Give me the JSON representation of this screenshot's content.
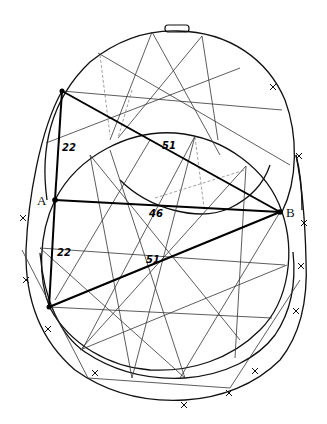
{
  "diagram": {
    "points": {
      "A": {
        "label": "A",
        "x": 55,
        "y": 200
      },
      "B": {
        "label": "B",
        "x": 280,
        "y": 212
      },
      "top_left": {
        "x": 62,
        "y": 91
      },
      "bottom_left": {
        "x": 49,
        "y": 307
      }
    },
    "measurements": [
      {
        "id": "seg-topleft-A",
        "label": "22",
        "from": "top_left",
        "to": "A"
      },
      {
        "id": "seg-topleft-B",
        "label": "51",
        "from": "top_left",
        "to": "B"
      },
      {
        "id": "seg-A-B",
        "label": "46",
        "from": "A",
        "to": "B"
      },
      {
        "id": "seg-A-bottomleft",
        "label": "22",
        "from": "A",
        "to": "bottom_left"
      },
      {
        "id": "seg-bottomleft-B",
        "label": "51",
        "from": "bottom_left",
        "to": "B"
      }
    ],
    "tab_label": ""
  }
}
